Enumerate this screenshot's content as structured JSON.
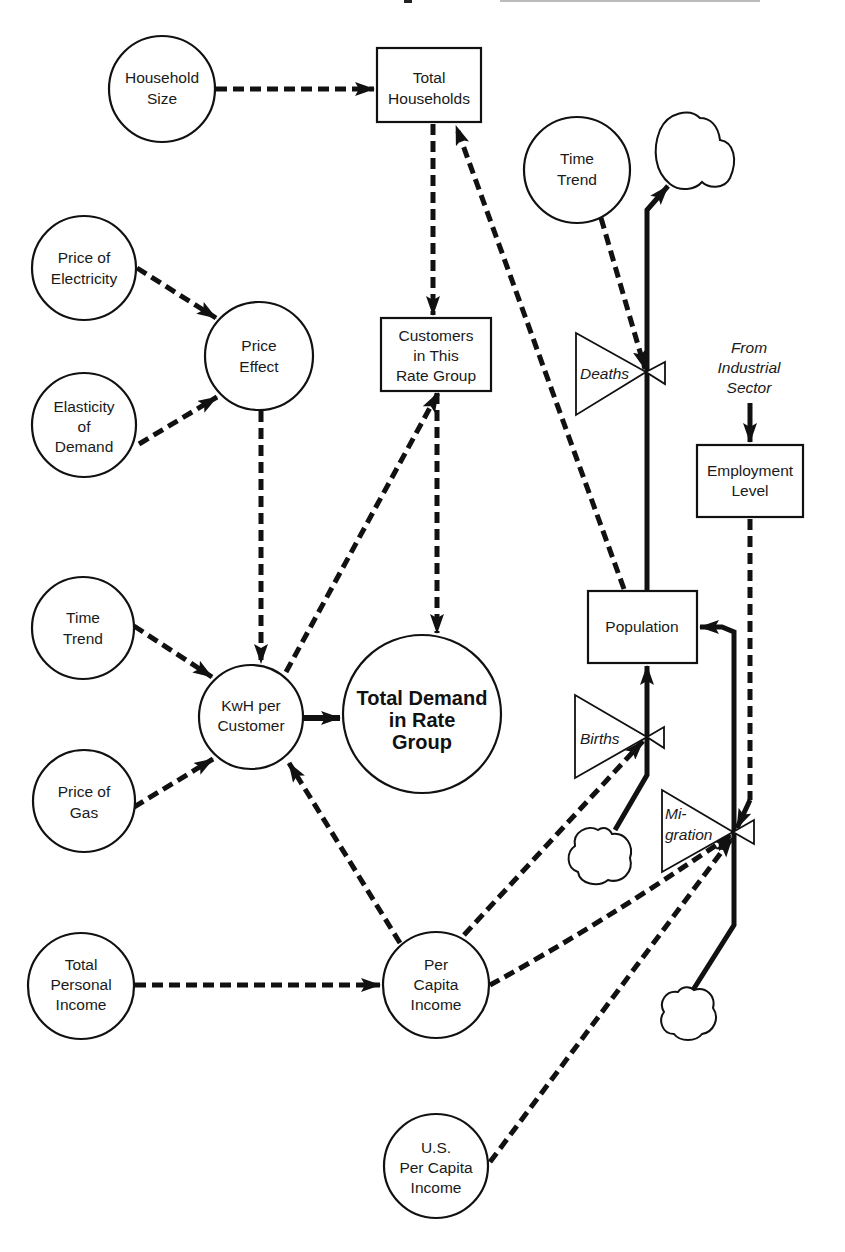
{
  "diagram": {
    "title_fragment": "p",
    "nodes": {
      "household_size": [
        "Household",
        "Size"
      ],
      "total_households": [
        "Total",
        "Households"
      ],
      "time_trend_top": [
        "Time",
        "Trend"
      ],
      "price_of_electricity": [
        "Price of",
        "Electricity"
      ],
      "price_effect": [
        "Price",
        "Effect"
      ],
      "elasticity_of_demand": [
        "Elasticity",
        "of",
        "Demand"
      ],
      "customers_in_rate_group": [
        "Customers",
        "in This",
        "Rate Group"
      ],
      "time_trend_left": [
        "Time",
        "Trend"
      ],
      "kwh_per_customer": [
        "KwH per",
        "Customer"
      ],
      "total_demand": [
        "Total Demand",
        "in Rate",
        "Group"
      ],
      "price_of_gas": [
        "Price of",
        "Gas"
      ],
      "population": [
        "Population"
      ],
      "employment_level": [
        "Employment",
        "Level"
      ],
      "from_industrial_sector": [
        "From",
        "Industrial",
        "Sector"
      ],
      "total_personal_income": [
        "Total",
        "Personal",
        "Income"
      ],
      "per_capita_income": [
        "Per",
        "Capita",
        "Income"
      ],
      "us_per_capita_income": [
        "U.S.",
        "Per Capita",
        "Income"
      ]
    },
    "valves": {
      "deaths": [
        "Deaths"
      ],
      "births": [
        "Births"
      ],
      "migration": [
        "Mi-",
        "gration"
      ]
    },
    "links": [
      {
        "from": "Household Size",
        "to": "Total Households",
        "type": "information"
      },
      {
        "from": "Total Households",
        "to": "Customers in This Rate Group",
        "type": "information"
      },
      {
        "from": "Population",
        "to": "Total Households",
        "type": "information"
      },
      {
        "from": "Time Trend",
        "to": "Deaths",
        "type": "information"
      },
      {
        "from": "Price of Electricity",
        "to": "Price Effect",
        "type": "information"
      },
      {
        "from": "Elasticity of Demand",
        "to": "Price Effect",
        "type": "information"
      },
      {
        "from": "Price Effect",
        "to": "KwH per Customer",
        "type": "information"
      },
      {
        "from": "KwH per Customer",
        "to": "Customers in This Rate Group",
        "type": "information"
      },
      {
        "from": "Customers in This Rate Group",
        "to": "Total Demand in Rate Group",
        "type": "information"
      },
      {
        "from": "Time Trend",
        "to": "KwH per Customer",
        "type": "information"
      },
      {
        "from": "Price of Gas",
        "to": "KwH per Customer",
        "type": "information"
      },
      {
        "from": "KwH per Customer",
        "to": "Total Demand in Rate Group",
        "type": "information"
      },
      {
        "from": "Per Capita Income",
        "to": "KwH per Customer",
        "type": "information"
      },
      {
        "from": "Total Personal Income",
        "to": "Per Capita Income",
        "type": "information"
      },
      {
        "from": "Per Capita Income",
        "to": "Births",
        "type": "information"
      },
      {
        "from": "Per Capita Income",
        "to": "Migration",
        "type": "information"
      },
      {
        "from": "U.S. Per Capita Income",
        "to": "Migration",
        "type": "information"
      },
      {
        "from": "Employment Level",
        "to": "Migration",
        "type": "information"
      },
      {
        "from": "From Industrial Sector",
        "to": "Employment Level",
        "type": "information"
      },
      {
        "from": "Population",
        "to": "Sink (Deaths)",
        "type": "flow"
      },
      {
        "from": "Source (Births)",
        "to": "Population",
        "type": "flow"
      },
      {
        "from": "Source (Migration)",
        "to": "Population",
        "type": "flow"
      }
    ]
  }
}
